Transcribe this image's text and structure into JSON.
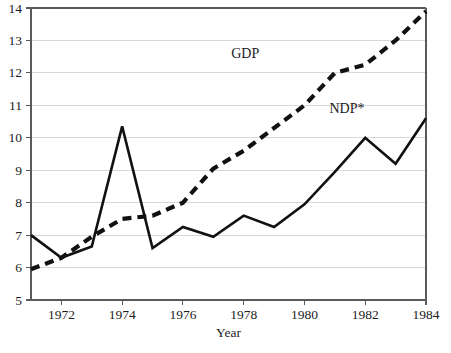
{
  "chart_data": {
    "type": "line",
    "title": "",
    "subtitle": "",
    "xlabel": "Year",
    "ylabel": "",
    "xlim": [
      1971,
      1984
    ],
    "ylim": [
      5,
      14
    ],
    "grid": true,
    "grid_axis": "y",
    "legend": "inline-annotations",
    "x": [
      1971,
      1972,
      1973,
      1974,
      1975,
      1976,
      1977,
      1978,
      1979,
      1980,
      1981,
      1982,
      1983,
      1984
    ],
    "xticks": [
      1972,
      1974,
      1976,
      1978,
      1980,
      1982,
      1984
    ],
    "xticklabels": [
      "1972",
      "1974",
      "1976",
      "1978",
      "1980",
      "1982",
      "1984"
    ],
    "yticks": [
      5,
      6,
      7,
      8,
      9,
      10,
      11,
      12,
      13,
      14
    ],
    "yticklabels": [
      "5",
      "6",
      "7",
      "8",
      "9",
      "10",
      "11",
      "12",
      "13",
      "14"
    ],
    "series": [
      {
        "name": "GDP",
        "label": "GDP",
        "style": "dashed",
        "color": "#111111",
        "values": [
          5.95,
          6.3,
          6.95,
          7.5,
          7.6,
          8.0,
          9.05,
          9.6,
          10.3,
          11.0,
          12.0,
          12.25,
          13.0,
          13.9
        ],
        "annotation": {
          "text": "GDP",
          "x": 1978.05,
          "y": 12.45
        }
      },
      {
        "name": "NDP*",
        "label": "NDP*",
        "style": "solid",
        "color": "#111111",
        "values": [
          7.0,
          6.3,
          6.65,
          10.35,
          6.6,
          7.25,
          6.95,
          7.6,
          7.25,
          7.95,
          8.95,
          10.0,
          9.2,
          10.6
        ],
        "annotation": {
          "text": "NDP*",
          "x": 1981.4,
          "y": 10.75
        }
      }
    ]
  },
  "axes": {
    "x_axis_title": "Year"
  }
}
